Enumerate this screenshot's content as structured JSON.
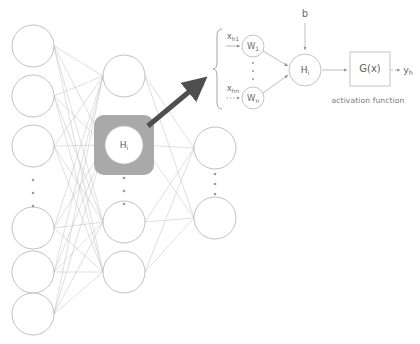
{
  "figure": {
    "background_color": "#ffffff",
    "line_color": "#b9b9bd",
    "node_stroke": "#a8a8ad",
    "text_color": "#6d6d6d",
    "highlight_color": "#a9a9a9",
    "arrow_color": "#4f4f4f"
  },
  "network": {
    "name": "feedforward-network",
    "layers": [
      {
        "name": "input-layer",
        "x": 33,
        "node_radius": 21,
        "nodes_top": [
          46,
          96,
          146
        ],
        "nodes_bottom": [
          228,
          272,
          314
        ],
        "ellipsis_y": [
          180,
          193,
          206
        ],
        "label": ""
      },
      {
        "name": "hidden-layer",
        "x": 124,
        "node_radius": 21,
        "nodes_top": [
          76
        ],
        "nodes_bottom": [
          222,
          272
        ],
        "ellipsis_y": [
          178,
          191,
          204
        ],
        "highlight_node": {
          "label": "H",
          "subscript": "i",
          "cx": 124,
          "cy": 145,
          "circle_radius": 19,
          "square_size": 60,
          "square_radius": 10
        }
      },
      {
        "name": "output-layer",
        "x": 215,
        "node_radius": 21,
        "nodes_top": [
          148
        ],
        "nodes_bottom": [
          218
        ],
        "ellipsis_y": [
          174,
          184,
          194
        ],
        "label": ""
      }
    ]
  },
  "detail": {
    "name": "neuron-detail-panel",
    "brace_label": "{",
    "inputs": [
      {
        "label": "x",
        "subscript": "h1",
        "weight_label": "W",
        "weight_subscript": "1",
        "y": 46
      },
      {
        "label": "x",
        "subscript": "hn",
        "weight_label": "W",
        "weight_subscript": "n",
        "y": 98
      }
    ],
    "input_ellipsis_y": [
      62,
      70,
      78
    ],
    "weight_node_radius": 11,
    "weight_x": 253,
    "summation": {
      "name": "summation-node",
      "label": "H",
      "subscript": "i",
      "cx": 305,
      "cy": 70,
      "radius": 16
    },
    "bias": {
      "name": "bias-input",
      "label": "b",
      "x": 305,
      "y": 14
    },
    "activation": {
      "name": "activation-box",
      "label": "G(x)",
      "x": 350,
      "y": 52,
      "width": 40,
      "height": 34,
      "caption": "activation function",
      "caption_x": 368,
      "caption_y": 100
    },
    "output": {
      "name": "output-value",
      "label": "y",
      "subscript": "h",
      "x": 404,
      "y": 70
    }
  },
  "callout": {
    "name": "zoom-callout-arrow",
    "from_x": 148,
    "from_y": 126,
    "to_x": 199,
    "to_y": 84
  }
}
